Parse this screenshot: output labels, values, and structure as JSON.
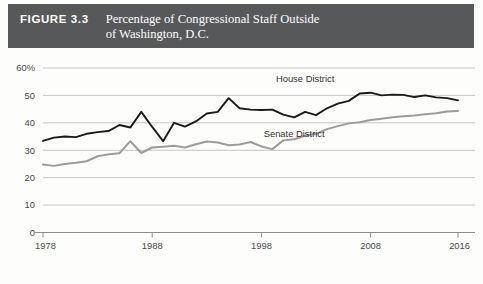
{
  "figure": {
    "number_label": "FIGURE 3.3",
    "title_line1": "Percentage of Congressional Staff Outside",
    "title_line2": "of Washington, D.C.",
    "banner_color": "#56585a"
  },
  "chart_data": {
    "type": "line",
    "title": "Percentage of Congressional Staff Outside of Washington, D.C.",
    "xlabel": "",
    "ylabel": "",
    "xlim": [
      1978,
      2016
    ],
    "ylim": [
      0,
      60
    ],
    "ytick_labels": [
      "60%",
      "50",
      "40",
      "30",
      "20",
      "10",
      "0"
    ],
    "yticks": [
      60,
      50,
      40,
      30,
      20,
      10,
      0
    ],
    "xtick_labels": [
      "1978",
      "1988",
      "1998",
      "2008",
      "2016"
    ],
    "xticks": [
      1978,
      1988,
      1998,
      2008,
      2016
    ],
    "grid": true,
    "legend": "inline-labels",
    "x": [
      1978,
      1979,
      1980,
      1981,
      1982,
      1983,
      1984,
      1985,
      1986,
      1987,
      1988,
      1989,
      1990,
      1991,
      1992,
      1993,
      1994,
      1995,
      1996,
      1997,
      1998,
      1999,
      2000,
      2001,
      2002,
      2003,
      2004,
      2005,
      2006,
      2007,
      2008,
      2009,
      2010,
      2011,
      2012,
      2013,
      2014,
      2015,
      2016
    ],
    "series": [
      {
        "name": "House District",
        "color": "#1a1a1a",
        "label_x": 2002,
        "label_y": 55,
        "values": [
          33.4,
          34.6,
          35.0,
          34.8,
          36.0,
          36.6,
          37.0,
          39.2,
          38.3,
          44.0,
          38.5,
          33.3,
          40.0,
          38.6,
          40.5,
          43.4,
          44.0,
          49.0,
          45.3,
          44.8,
          44.7,
          44.8,
          43.0,
          42.0,
          44.0,
          42.8,
          45.3,
          47.0,
          48.0,
          50.7,
          51.0,
          50.0,
          50.3,
          50.2,
          49.4,
          50.0,
          49.3,
          49.0,
          48.2
        ]
      },
      {
        "name": "Senate District",
        "color": "#9c9c9c",
        "label_x": 2001,
        "label_y": 35,
        "values": [
          24.8,
          24.3,
          25.0,
          25.4,
          26.0,
          27.8,
          28.5,
          28.9,
          33.3,
          29.0,
          31.0,
          31.3,
          31.6,
          31.0,
          32.2,
          33.2,
          32.8,
          31.8,
          32.1,
          33.0,
          31.4,
          30.4,
          33.6,
          34.0,
          35.3,
          36.0,
          37.7,
          38.8,
          39.8,
          40.2,
          41.0,
          41.5,
          42.0,
          42.4,
          42.7,
          43.1,
          43.5,
          44.1,
          44.3
        ]
      }
    ]
  }
}
